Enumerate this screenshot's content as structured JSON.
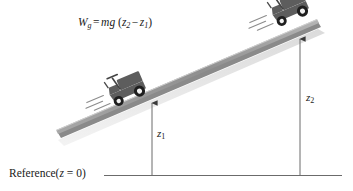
{
  "diagram": {
    "formula": {
      "lhs_symbol": "W",
      "lhs_subscript": "g",
      "equals": "=",
      "rhs_mg": "mg",
      "open_paren": "(",
      "term1_symbol": "z",
      "term1_subscript": "2",
      "minus": "−",
      "term2_symbol": "z",
      "term2_subscript": "1",
      "close_paren": ")",
      "plain_text": "W_g = mg (z2 − z1)"
    },
    "height_markers": [
      {
        "id": "z1",
        "symbol": "z",
        "subscript": "1",
        "plain_text": "z1",
        "description": "height of lower vehicle above reference"
      },
      {
        "id": "z2",
        "symbol": "z",
        "subscript": "2",
        "plain_text": "z2",
        "description": "height of upper vehicle above reference"
      }
    ],
    "reference_line": {
      "label_text": "Reference",
      "paren_open": "(",
      "var": "z",
      "equals": "=",
      "value": "0",
      "paren_close": ")",
      "plain_text": "Reference (z = 0)"
    },
    "vehicles": [
      {
        "id": "lower-vehicle",
        "name": "tractor-lower",
        "position": "lower portion of incline",
        "wheels": 2,
        "motion_lines": 3
      },
      {
        "id": "upper-vehicle",
        "name": "tractor-upper",
        "position": "upper portion of incline",
        "wheels": 2,
        "motion_lines": 3
      }
    ],
    "colors": {
      "vehicle_body": "#575757",
      "vehicle_dark": "#2e2e2e",
      "ramp_top": "#9a9a9a",
      "ramp_shadow": "#c9c9c9",
      "line": "#6b6b6b",
      "text": "#1a1a1a",
      "background": "#ffffff"
    }
  }
}
